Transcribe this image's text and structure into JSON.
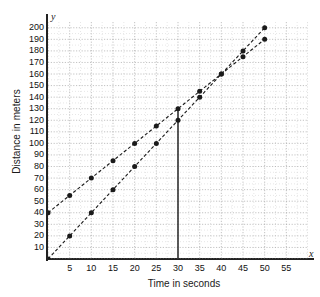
{
  "chart_data": {
    "type": "line",
    "title": "",
    "xlabel": "Time in seconds",
    "ylabel": "Distance in meters",
    "x_axis_letter": "y",
    "y_axis_letter": "x",
    "xlim": [
      0,
      60
    ],
    "ylim": [
      0,
      205
    ],
    "grid": true,
    "legend": "none",
    "xticks": [
      5,
      10,
      15,
      20,
      25,
      30,
      35,
      40,
      45,
      50,
      55
    ],
    "yticks": [
      10,
      20,
      30,
      40,
      50,
      60,
      70,
      80,
      90,
      100,
      110,
      120,
      130,
      140,
      150,
      160,
      170,
      180,
      190,
      200
    ],
    "series": [
      {
        "name": "line-through-origin",
        "style": "dashed-with-markers",
        "color": "#1a1a1a",
        "slope": 4,
        "intercept": 0,
        "x": [
          0,
          5,
          10,
          15,
          20,
          25,
          30,
          35,
          40,
          45,
          50
        ],
        "values": [
          0,
          20,
          40,
          60,
          80,
          100,
          120,
          140,
          160,
          180,
          200
        ]
      },
      {
        "name": "line-intercept-40",
        "style": "dashed-with-markers",
        "color": "#1a1a1a",
        "slope": 3,
        "intercept": 40,
        "x": [
          0,
          5,
          10,
          15,
          20,
          25,
          30,
          35,
          40,
          45,
          50
        ],
        "values": [
          40,
          55,
          70,
          85,
          100,
          115,
          130,
          145,
          160,
          175,
          190
        ]
      }
    ],
    "annotations": [
      {
        "name": "vertical-reference-line",
        "type": "vline",
        "x": 30,
        "y_from": 0,
        "y_to": 130,
        "color": "#333333"
      }
    ]
  }
}
